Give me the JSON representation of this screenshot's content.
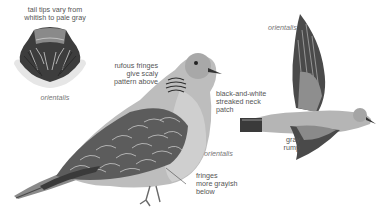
{
  "plate": {
    "background": "#ffffff",
    "label_color": "#555555",
    "illustrations": [
      {
        "id": "tail-fan",
        "subject": "tail, spread (orientalis)"
      },
      {
        "id": "perched-dove",
        "subject": "perched Oriental Turtle-Dove"
      },
      {
        "id": "flying-dove",
        "subject": "Oriental Turtle-Dove in flight"
      }
    ],
    "labels": {
      "tail_tips": [
        "tail tips vary from",
        "whitish to pale gray"
      ],
      "tail_subspecies": "orientalis",
      "rufous_fringes": [
        "rufous fringes",
        "give scaly",
        "pattern above"
      ],
      "neck_patch": [
        "black-and-white",
        "streaked neck",
        "patch"
      ],
      "perched_subspecies": "orientalis",
      "fringes_below": [
        "fringes",
        "more grayish",
        "below"
      ],
      "flight_subspecies": "orientalis",
      "gray_rump": [
        "gray",
        "rump"
      ]
    }
  }
}
